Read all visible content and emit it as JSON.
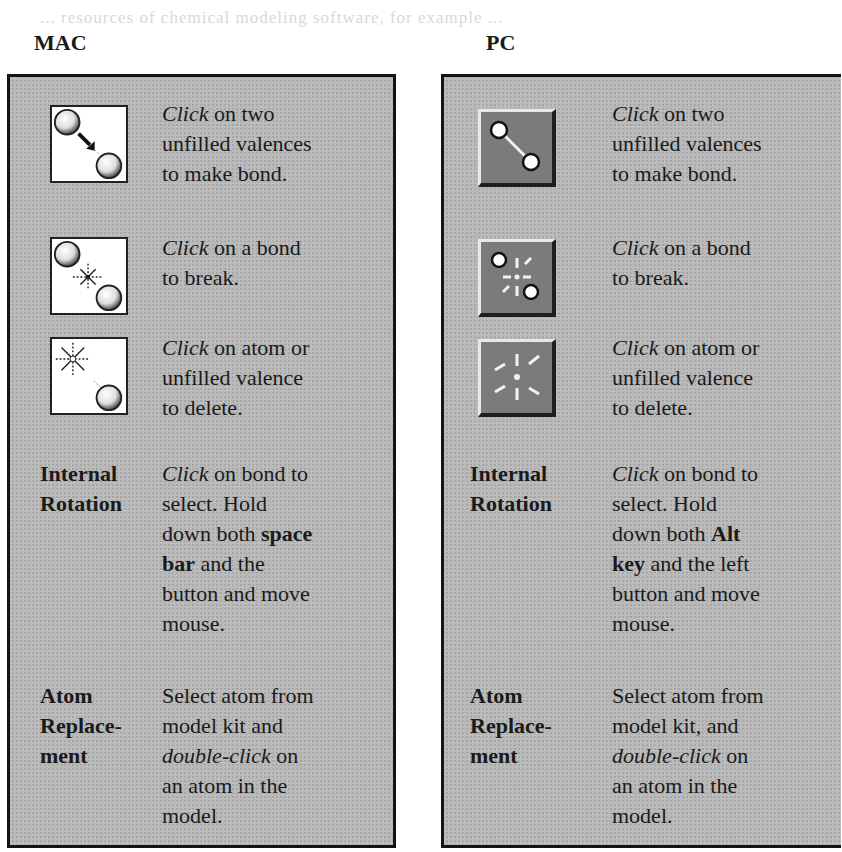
{
  "faded_header_text": "... resources of chemical modeling software, for example ...",
  "columns": {
    "mac": {
      "heading": "MAC",
      "icon_rows": [
        {
          "icon": "make-bond-icon",
          "lines": [
            {
              "em": "Click",
              "text": " on two"
            },
            {
              "text": "unfilled valences"
            },
            {
              "text": "to make bond."
            }
          ]
        },
        {
          "icon": "break-bond-icon",
          "lines": [
            {
              "em": "Click",
              "text": " on a bond"
            },
            {
              "text": "to break."
            }
          ]
        },
        {
          "icon": "delete-atom-icon",
          "lines": [
            {
              "em": "Click",
              "text": " on atom or"
            },
            {
              "text": "unfilled valence"
            },
            {
              "text": "to delete."
            }
          ]
        }
      ],
      "internal_rotation": {
        "label_lines": [
          "Internal",
          "Rotation"
        ],
        "lines": [
          {
            "em": "Click",
            "text": " on bond to"
          },
          {
            "text": "select. Hold"
          },
          {
            "pre": "down both ",
            "strong": "space"
          },
          {
            "strong": "bar",
            "text": " and the"
          },
          {
            "text": "button and move"
          },
          {
            "text": "mouse."
          }
        ]
      },
      "atom_replacement": {
        "label_lines": [
          "Atom",
          "Replace-",
          "ment"
        ],
        "lines": [
          {
            "text": "Select atom from"
          },
          {
            "text": "model kit and"
          },
          {
            "em": "double-click",
            "text": " on"
          },
          {
            "text": "an atom in the"
          },
          {
            "text": "model."
          }
        ]
      }
    },
    "pc": {
      "heading": "PC",
      "icon_rows": [
        {
          "icon": "make-bond-icon",
          "lines": [
            {
              "em": "Click",
              "text": " on two"
            },
            {
              "text": "unfilled valences"
            },
            {
              "text": "to make bond."
            }
          ]
        },
        {
          "icon": "break-bond-icon",
          "lines": [
            {
              "em": "Click",
              "text": " on a bond"
            },
            {
              "text": "to break."
            }
          ]
        },
        {
          "icon": "delete-atom-icon",
          "lines": [
            {
              "em": "Click",
              "text": " on atom or"
            },
            {
              "text": "unfilled valence"
            },
            {
              "text": "to delete."
            }
          ]
        }
      ],
      "internal_rotation": {
        "label_lines": [
          "Internal",
          "Rotation"
        ],
        "lines": [
          {
            "em": "Click",
            "text": " on bond to"
          },
          {
            "text": "select. Hold"
          },
          {
            "pre": "down both ",
            "strong": "Alt"
          },
          {
            "strong": "key",
            "text": " and the left"
          },
          {
            "text": "button and move"
          },
          {
            "text": "mouse."
          }
        ]
      },
      "atom_replacement": {
        "label_lines": [
          "Atom",
          "Replace-",
          "ment"
        ],
        "lines": [
          {
            "text": "Select atom from"
          },
          {
            "text": "model kit, and"
          },
          {
            "em": "double-click",
            "text": " on"
          },
          {
            "text": "an atom in the"
          },
          {
            "text": "model."
          }
        ]
      }
    }
  },
  "colors": {
    "panel_bg": "#b9b9b9",
    "panel_border": "#141414",
    "pc_button_face": "#7b7b7b"
  }
}
